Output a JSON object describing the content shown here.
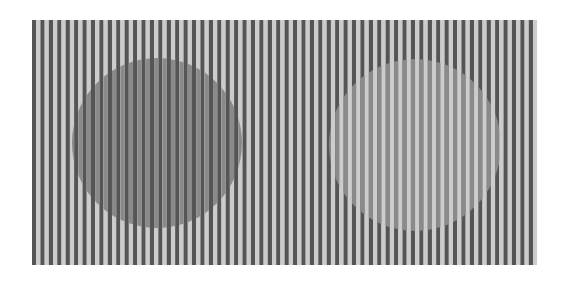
{
  "illusion": {
    "type": "White's illusion (grating with gray disks)",
    "canvas": {
      "width": 568,
      "height": 284,
      "background": "#ffffff"
    },
    "grating": {
      "x": 32,
      "y": 20,
      "width": 505,
      "height": 245,
      "period": 8.42,
      "dark_color": "#555555",
      "light_color": "#cccccc",
      "orientation": "vertical"
    },
    "disks": [
      {
        "name": "left-disk",
        "cx": 157,
        "cy": 143,
        "r": 85,
        "fill": "#8a8a8a",
        "replaces": "light"
      },
      {
        "name": "right-disk",
        "cx": 415,
        "cy": 145,
        "r": 86,
        "fill": "#8a8a8a",
        "replaces": "dark"
      }
    ]
  }
}
